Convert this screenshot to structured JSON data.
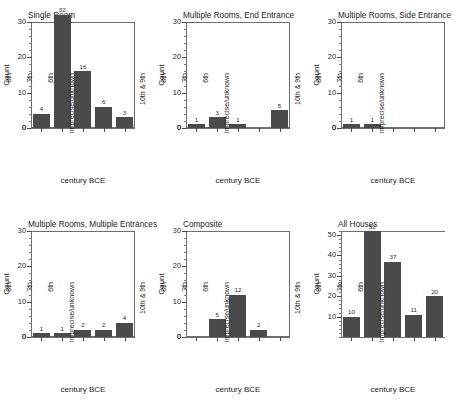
{
  "figure": {
    "background": "#ffffff",
    "bar_color": "#4a4a4a",
    "axis_color": "#6e6e6e",
    "y_title": "Count",
    "x_title": "century BCE"
  },
  "chart_data": [
    {
      "type": "bar",
      "title": "Single Room",
      "xlabel": "century BCE",
      "ylabel": "Count",
      "categories": [
        "10th & 9th",
        "8th",
        "7th",
        "6th",
        "imprecise/unknown"
      ],
      "values": [
        4,
        32,
        16,
        6,
        3
      ],
      "value_labels": [
        "4",
        "32",
        "16",
        "6",
        "3"
      ],
      "ylim": [
        0,
        30
      ],
      "yticks": [
        0,
        10,
        20,
        30
      ],
      "ytick_labels": [
        "0",
        "10",
        "20",
        "30"
      ],
      "grid": false,
      "legend": "none"
    },
    {
      "type": "bar",
      "title": "Multiple Rooms, End Entrance",
      "xlabel": "century BCE",
      "ylabel": "Count",
      "categories": [
        "10th & 9th",
        "8th",
        "7th",
        "6th",
        "imprecise/unknown"
      ],
      "values": [
        1,
        3,
        1,
        0,
        5
      ],
      "value_labels": [
        "1",
        "3",
        "1",
        "",
        "5"
      ],
      "ylim": [
        0,
        30
      ],
      "yticks": [
        0,
        10,
        20,
        30
      ],
      "ytick_labels": [
        "0",
        "10",
        "20",
        "30"
      ],
      "grid": false,
      "legend": "none"
    },
    {
      "type": "bar",
      "title": "Multiple Rooms, Side Entrance",
      "xlabel": "century BCE",
      "ylabel": "Count",
      "categories": [
        "10th & 9th",
        "8th",
        "7th",
        "6th",
        "imprecise/unknown"
      ],
      "values": [
        1,
        1,
        0,
        0,
        0
      ],
      "value_labels": [
        "1",
        "1",
        "",
        "",
        ""
      ],
      "ylim": [
        0,
        30
      ],
      "yticks": [
        0,
        10,
        20,
        30
      ],
      "ytick_labels": [
        "0",
        "10",
        "20",
        "30"
      ],
      "grid": false,
      "legend": "none"
    },
    {
      "type": "bar",
      "title": "Multiple Rooms, Multiple Entrances",
      "xlabel": "century BCE",
      "ylabel": "Count",
      "categories": [
        "10th & 9th",
        "8th",
        "7th",
        "6th",
        "imprecise/unknown"
      ],
      "values": [
        1,
        1,
        2,
        2,
        4
      ],
      "value_labels": [
        "1",
        "1",
        "2",
        "2",
        "4"
      ],
      "ylim": [
        0,
        30
      ],
      "yticks": [
        0,
        10,
        20,
        30
      ],
      "ytick_labels": [
        "0",
        "10",
        "20",
        "30"
      ],
      "grid": false,
      "legend": "none"
    },
    {
      "type": "bar",
      "title": "Composite",
      "xlabel": "century BCE",
      "ylabel": "Count",
      "categories": [
        "10th & 9th",
        "8th",
        "7th",
        "6th",
        "imprecise/unknown"
      ],
      "values": [
        0,
        5,
        12,
        2,
        0
      ],
      "value_labels": [
        "",
        "5",
        "12",
        "2",
        ""
      ],
      "ylim": [
        0,
        30
      ],
      "yticks": [
        0,
        10,
        20,
        30
      ],
      "ytick_labels": [
        "0",
        "10",
        "20",
        "30"
      ],
      "grid": false,
      "legend": "none"
    },
    {
      "type": "bar",
      "title": "All Houses",
      "xlabel": "century BCE",
      "ylabel": "Count",
      "categories": [
        "10th & 9th",
        "8th",
        "7th",
        "6th",
        "imprecise/unknown"
      ],
      "values": [
        10,
        52,
        37,
        11,
        20
      ],
      "value_labels": [
        "10",
        "52",
        "37",
        "11",
        "20"
      ],
      "ylim": [
        0,
        52
      ],
      "yticks": [
        10,
        20,
        30,
        40,
        50
      ],
      "ytick_labels": [
        "10",
        "20",
        "30",
        "40",
        "50"
      ],
      "grid": false,
      "legend": "none"
    }
  ]
}
